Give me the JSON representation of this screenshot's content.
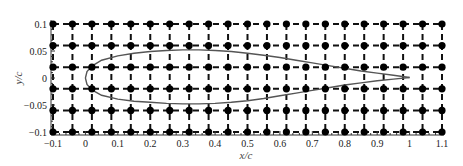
{
  "chart_data": {
    "type": "scatter",
    "title": "",
    "xlabel": "x/c",
    "ylabel": "y/c",
    "xlim": [
      -0.1,
      1.1
    ],
    "ylim": [
      -0.1,
      0.1
    ],
    "x_ticks": [
      -0.1,
      0,
      0.1,
      0.2,
      0.3,
      0.4,
      0.5,
      0.6,
      0.7,
      0.8,
      0.9,
      1,
      1.1
    ],
    "x_tick_labels": [
      "−0.1",
      "0",
      "0.1",
      "0.2",
      "0.3",
      "0.4",
      "0.5",
      "0.6",
      "0.7",
      "0.8",
      "0.9",
      "1",
      "1.1"
    ],
    "y_ticks": [
      0.1,
      0.05,
      0,
      -0.05,
      -0.1
    ],
    "y_tick_labels": [
      "0.1",
      "0.05",
      "0",
      "−0.05",
      "−0.1"
    ],
    "grid": {
      "style": "dashed",
      "x_nodes": [
        -0.1,
        -0.04,
        0.02,
        0.08,
        0.14,
        0.2,
        0.26,
        0.32,
        0.38,
        0.44,
        0.5,
        0.56,
        0.62,
        0.68,
        0.74,
        0.8,
        0.86,
        0.92,
        0.98,
        1.04,
        1.1
      ],
      "y_nodes": [
        0.1,
        0.06,
        0.02,
        -0.02,
        -0.06,
        -0.1
      ],
      "node_marker": "filled-circle"
    },
    "series": [
      {
        "name": "airfoil-upper",
        "type": "line",
        "color": "#555555",
        "x": [
          0,
          0.005,
          0.02,
          0.05,
          0.1,
          0.15,
          0.2,
          0.25,
          0.3,
          0.35,
          0.4,
          0.45,
          0.5,
          0.55,
          0.6,
          0.65,
          0.7,
          0.75,
          0.8,
          0.85,
          0.9,
          0.95,
          1.0
        ],
        "y": [
          0,
          0.012,
          0.022,
          0.033,
          0.041,
          0.046,
          0.049,
          0.051,
          0.052,
          0.052,
          0.051,
          0.049,
          0.046,
          0.042,
          0.038,
          0.033,
          0.028,
          0.023,
          0.018,
          0.013,
          0.009,
          0.005,
          0.001
        ]
      },
      {
        "name": "airfoil-lower",
        "type": "line",
        "color": "#555555",
        "x": [
          0,
          0.005,
          0.02,
          0.05,
          0.1,
          0.15,
          0.2,
          0.25,
          0.3,
          0.35,
          0.4,
          0.45,
          0.5,
          0.55,
          0.6,
          0.65,
          0.7,
          0.75,
          0.8,
          0.85,
          0.9,
          0.95,
          1.0
        ],
        "y": [
          0,
          -0.012,
          -0.022,
          -0.032,
          -0.039,
          -0.043,
          -0.045,
          -0.047,
          -0.048,
          -0.048,
          -0.047,
          -0.045,
          -0.042,
          -0.038,
          -0.033,
          -0.028,
          -0.023,
          -0.018,
          -0.013,
          -0.009,
          -0.005,
          -0.002,
          0.001
        ]
      }
    ],
    "legend": null
  },
  "colors": {
    "grid": "#111111",
    "node": "#000000",
    "airfoil": "#555555",
    "axis": "#333333"
  }
}
